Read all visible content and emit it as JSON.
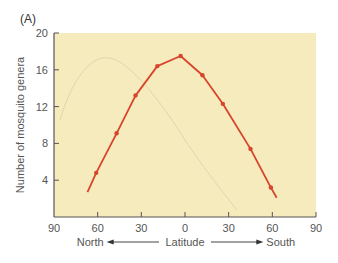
{
  "panel_label": "(A)",
  "colors": {
    "plot_background": "#f6ebbd",
    "line": "#d6452c",
    "axis": "#555555",
    "ghost_curve": "#d9d0a8"
  },
  "chart_data": {
    "type": "line",
    "title": "",
    "xlabel": "Latitude",
    "x_direction_labels": {
      "left": "North",
      "right": "South"
    },
    "ylabel": "Number of mosquito genera",
    "xlim": [
      -90,
      90
    ],
    "ylim": [
      0,
      20
    ],
    "x_ticks": [
      -90,
      -60,
      -30,
      0,
      30,
      60,
      90
    ],
    "x_tick_labels": [
      "90",
      "60",
      "30",
      "0",
      "30",
      "60",
      "90"
    ],
    "y_ticks": [
      4,
      8,
      12,
      16,
      20
    ],
    "y_tick_labels": [
      "4",
      "8",
      "12",
      "16",
      "20"
    ],
    "grid": false,
    "legend": null,
    "note": "Negative x = degrees North, positive x = degrees South",
    "series": [
      {
        "name": "Mosquito genera",
        "line_start": {
          "x": -67,
          "y": 2.7
        },
        "line_end": {
          "x": 63,
          "y": 2.1
        },
        "points": [
          {
            "x": -61,
            "y": 4.8
          },
          {
            "x": -47,
            "y": 9.1
          },
          {
            "x": -34,
            "y": 13.2
          },
          {
            "x": -19,
            "y": 16.4
          },
          {
            "x": -3,
            "y": 17.5
          },
          {
            "x": 12,
            "y": 15.4
          },
          {
            "x": 26,
            "y": 12.3
          },
          {
            "x": 45,
            "y": 7.4
          },
          {
            "x": 59,
            "y": 3.2
          }
        ]
      }
    ]
  }
}
